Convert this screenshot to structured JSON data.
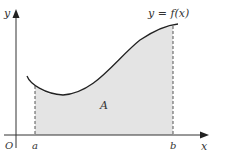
{
  "diagram": {
    "curve_label": "y = f(x)",
    "area_label": "A",
    "origin_label": "O",
    "x_axis_label": "x",
    "y_axis_label": "y",
    "lower_bound_label": "a",
    "upper_bound_label": "b",
    "colors": {
      "curve": "#222222",
      "axes": "#333333",
      "shading": "#e4e4e4",
      "dashes": "#555555"
    }
  }
}
